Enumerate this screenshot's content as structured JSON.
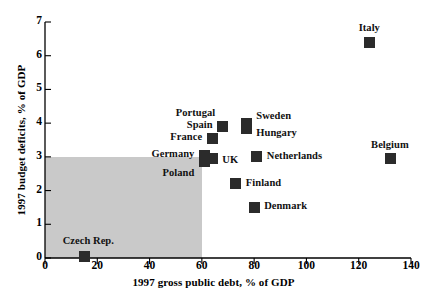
{
  "chart_data": {
    "type": "scatter",
    "title": "",
    "xlabel": "1997 gross public debt, % of GDP",
    "ylabel": "1997 budget deficits, % of GDP",
    "xlim": [
      0,
      140
    ],
    "ylim": [
      0,
      7
    ],
    "xticks": [
      0,
      20,
      40,
      60,
      80,
      100,
      120,
      140
    ],
    "yticks": [
      0,
      1,
      2,
      3,
      4,
      5,
      6,
      7
    ],
    "grid": false,
    "legend": "none",
    "marker_color": "#2b2b2b",
    "shaded_region": {
      "name": "maastricht-criteria-region",
      "x_range": [
        0,
        60
      ],
      "y_range": [
        0,
        3
      ],
      "color": "#c9c9c9"
    },
    "points": [
      {
        "name": "Italy",
        "x": 124,
        "y": 6.4,
        "label_dx": 0,
        "label_dy": -13,
        "label_align": "center"
      },
      {
        "name": "Portugal",
        "x": 68,
        "y": 3.9,
        "label_dx": -8,
        "label_dy": -13,
        "label_align": "right"
      },
      {
        "name": "Spain",
        "x": 68,
        "y": 3.9,
        "label_dx": -10,
        "label_dy": -1,
        "label_align": "right"
      },
      {
        "name": "Sweden",
        "x": 77,
        "y": 4.0,
        "label_dx": 10,
        "label_dy": -6,
        "label_align": "left"
      },
      {
        "name": "Hungary",
        "x": 77,
        "y": 3.85,
        "label_dx": 10,
        "label_dy": 6,
        "label_align": "left"
      },
      {
        "name": "France",
        "x": 64,
        "y": 3.55,
        "label_dx": -10,
        "label_dy": 0,
        "label_align": "right"
      },
      {
        "name": "Germany",
        "x": 61,
        "y": 3.05,
        "label_dx": -10,
        "label_dy": 0,
        "label_align": "right"
      },
      {
        "name": "UK",
        "x": 64,
        "y": 2.95,
        "label_dx": 10,
        "label_dy": 2,
        "label_align": "left"
      },
      {
        "name": "Poland",
        "x": 61,
        "y": 2.85,
        "label_dx": -10,
        "label_dy": 12,
        "label_align": "right"
      },
      {
        "name": "Netherlands",
        "x": 81,
        "y": 3.0,
        "label_dx": 10,
        "label_dy": 0,
        "label_align": "left"
      },
      {
        "name": "Belgium",
        "x": 132,
        "y": 2.95,
        "label_dx": 0,
        "label_dy": -13,
        "label_align": "center"
      },
      {
        "name": "Finland",
        "x": 73,
        "y": 2.2,
        "label_dx": 10,
        "label_dy": 0,
        "label_align": "left"
      },
      {
        "name": "Denmark",
        "x": 80,
        "y": 1.5,
        "label_dx": 10,
        "label_dy": 0,
        "label_align": "left"
      },
      {
        "name": "Czech Rep.",
        "x": 15,
        "y": 0.05,
        "label_dx": 4,
        "label_dy": -14,
        "label_align": "center"
      }
    ]
  }
}
